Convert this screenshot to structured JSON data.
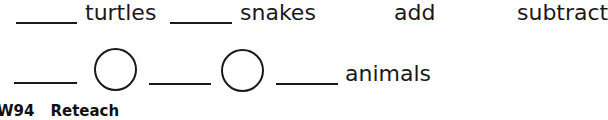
{
  "row1": {
    "labels": {
      "turtles": "turtles",
      "snakes": "snakes"
    },
    "choices": {
      "add": "add",
      "subtract": "subtract"
    }
  },
  "row2": {
    "result_label": "animals"
  },
  "footer": {
    "page_code": "W94",
    "section": "Reteach"
  },
  "colors": {
    "ink": "#1a1a1a",
    "background": "#ffffff"
  }
}
